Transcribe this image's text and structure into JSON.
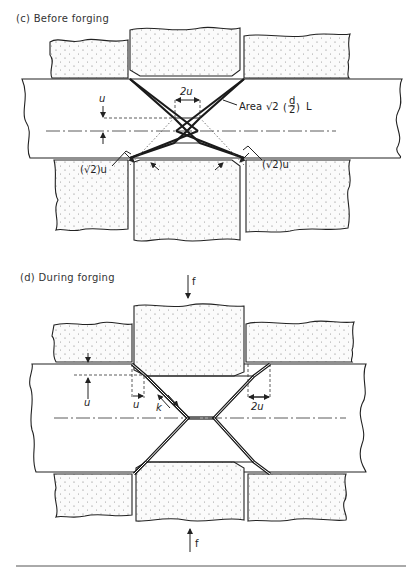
{
  "figure": {
    "panel_c": {
      "title": "(c) Before forging",
      "labels": {
        "u": "u",
        "two_u": "2u",
        "area_prefix": "Area",
        "area_formula": "√2 (d/2) L",
        "area_sqrt": "√2",
        "area_frac_num": "d",
        "area_frac_den": "2",
        "area_L": "L",
        "sqrt2u_left": "(√2)u",
        "sqrt2u_right": "(√2)u"
      }
    },
    "panel_d": {
      "title": "(d) During forging",
      "labels": {
        "f_top": "f",
        "f_bottom": "f",
        "u_left": "u",
        "u_horiz": "u",
        "k": "k",
        "two_u": "2u"
      }
    }
  },
  "colors": {
    "ink": "#222222",
    "background": "#ffffff",
    "stipple": "#888888"
  }
}
